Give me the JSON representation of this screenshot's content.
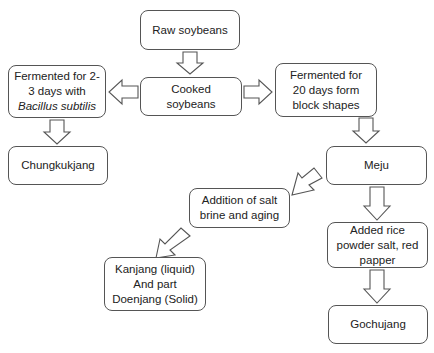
{
  "nodes": {
    "raw_soybeans": {
      "label": "Raw soybeans"
    },
    "cooked_soybeans": {
      "label": "Cooked soybeans"
    },
    "fermented_short": {
      "line1": "Fermented for 2-",
      "line2": "3 days with",
      "line3": "Bacillus subtilis"
    },
    "fermented_long": {
      "line1": "Fermented for",
      "line2": "20 days form",
      "line3": "block shapes"
    },
    "chungkukjang": {
      "label": "Chungkukjang"
    },
    "meju": {
      "label": "Meju"
    },
    "salt_brine": {
      "line1": "Addition of salt",
      "line2": "brine and aging"
    },
    "added_rice": {
      "line1": "Added rice",
      "line2": "powder salt, red",
      "line3": "papper"
    },
    "kanjang": {
      "line1": "Kanjang (liquid)",
      "line2": "And part",
      "line3": "Doenjang (Solid)"
    },
    "gochujang": {
      "label": "Gochujang"
    }
  },
  "edges": [
    {
      "from": "Raw soybeans",
      "to": "Cooked soybeans"
    },
    {
      "from": "Cooked soybeans",
      "to": "Fermented for 2-3 days with Bacillus subtilis"
    },
    {
      "from": "Cooked soybeans",
      "to": "Fermented for 20 days form block shapes"
    },
    {
      "from": "Fermented for 2-3 days with Bacillus subtilis",
      "to": "Chungkukjang"
    },
    {
      "from": "Fermented for 20 days form block shapes",
      "to": "Meju"
    },
    {
      "from": "Meju",
      "to": "Addition of salt brine and aging"
    },
    {
      "from": "Meju",
      "to": "Added rice powder salt, red papper"
    },
    {
      "from": "Addition of salt brine and aging",
      "to": "Kanjang (liquid) And part Doenjang (Solid)"
    },
    {
      "from": "Added rice powder salt, red papper",
      "to": "Gochujang"
    }
  ],
  "colors": {
    "border": "#555555",
    "arrow_stroke": "#555555",
    "fill": "#ffffff"
  }
}
